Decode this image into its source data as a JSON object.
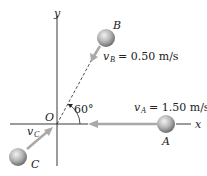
{
  "diagram": {
    "axes": {
      "x_label": "x",
      "y_label": "y",
      "origin_label": "O"
    },
    "angle": {
      "label": "60°",
      "degrees": 60
    },
    "balls": [
      {
        "name": "A",
        "label": "A",
        "velocity_symbol": "v",
        "velocity_sub": "A",
        "velocity_eq": "= 1.50 m/s"
      },
      {
        "name": "B",
        "label": "B",
        "velocity_symbol": "v",
        "velocity_sub": "B",
        "velocity_eq": "= 0.50 m/s"
      },
      {
        "name": "C",
        "label": "C",
        "velocity_symbol": "v",
        "velocity_sub": "C",
        "velocity_eq": ""
      }
    ],
    "colors": {
      "arrow": "#a9a9a9",
      "ball": "#a8a8a8",
      "axis": "#222222"
    }
  }
}
